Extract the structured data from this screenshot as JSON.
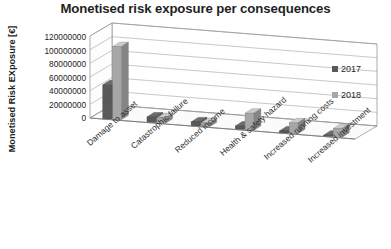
{
  "chart": {
    "title": "Monetised risk exposure per consequences",
    "ylabel": "Monetised Risk EXposure [€]",
    "legend": {
      "items": [
        {
          "label": "2017",
          "color": "#595959"
        },
        {
          "label": "2018",
          "color": "#a6a6a6"
        }
      ]
    }
  },
  "chart_data": {
    "type": "bar",
    "title": "Monetised risk exposure per consequences",
    "xlabel": "",
    "ylabel": "Monetised Risk EXposure [€]",
    "ylim": [
      0,
      120000000
    ],
    "yticks": [
      0,
      20000000,
      40000000,
      60000000,
      80000000,
      100000000,
      120000000
    ],
    "ytick_labels": [
      "0",
      "20000000",
      "40000000",
      "60000000",
      "80000000",
      "100000000",
      "120000000"
    ],
    "grid": true,
    "legend_position": "right",
    "three_d": true,
    "categories": [
      "Damage to asset",
      "Catastrophic failure",
      "Reduced income",
      "Health & safety hazard",
      "Increased running costs",
      "Increased investment"
    ],
    "series": [
      {
        "name": "2017",
        "color": "#595959",
        "values": [
          50000000,
          8000000,
          6000000,
          5000000,
          3000000,
          2000000
        ]
      },
      {
        "name": "2018",
        "color": "#a6a6a6",
        "values": [
          107000000,
          8000000,
          6000000,
          25000000,
          16000000,
          13000000
        ]
      }
    ]
  }
}
